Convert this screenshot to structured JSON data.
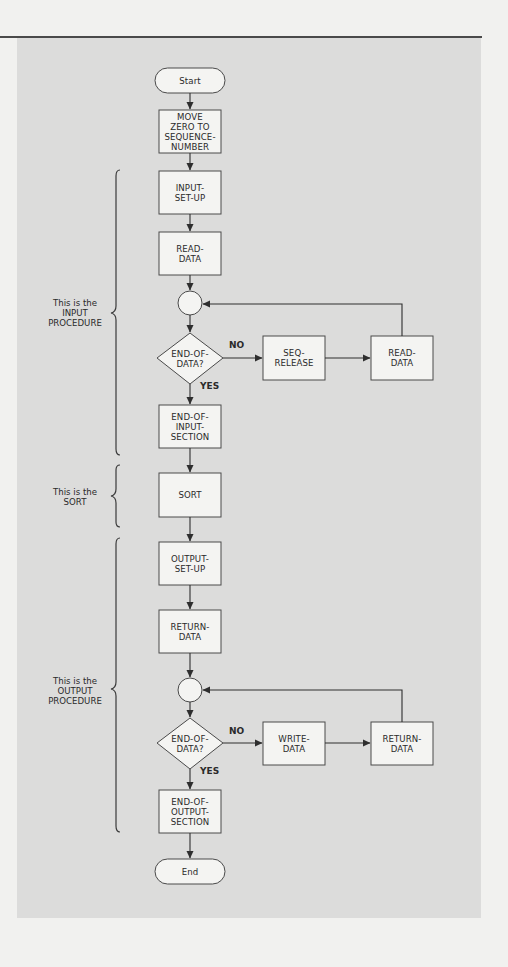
{
  "figure": {
    "nodes": {
      "start": "Start",
      "move_zero": "MOVE\nZERO TO\nSEQUENCE-\nNUMBER",
      "input_set_up": "INPUT-\nSET-UP",
      "read_data_1": "READ-\nDATA",
      "decision_1": "END-OF-\nDATA?",
      "seq_release": "SEQ-\nRELEASE",
      "read_data_2": "READ-\nDATA",
      "end_of_input_section": "END-OF-\nINPUT-\nSECTION",
      "sort": "SORT",
      "output_set_up": "OUTPUT-\nSET-UP",
      "return_data_1": "RETURN-\nDATA",
      "decision_2": "END-OF-\nDATA?",
      "write_data": "WRITE-\nDATA",
      "return_data_2": "RETURN-\nDATA",
      "end_of_output_section": "END-OF-\nOUTPUT-\nSECTION",
      "end": "End"
    },
    "branch_labels": {
      "no_1": "NO",
      "yes_1": "YES",
      "no_2": "NO",
      "yes_2": "YES"
    },
    "brace_labels": {
      "input": "This is the\nINPUT\nPROCEDURE",
      "sort": "This is the\nSORT",
      "output": "This is the\nOUTPUT\nPROCEDURE"
    },
    "colors": {
      "panel": "#dcdcdb",
      "box_fill": "#f4f4f2",
      "stroke": "#3a3a3a",
      "page": "#f1f1ef"
    }
  }
}
